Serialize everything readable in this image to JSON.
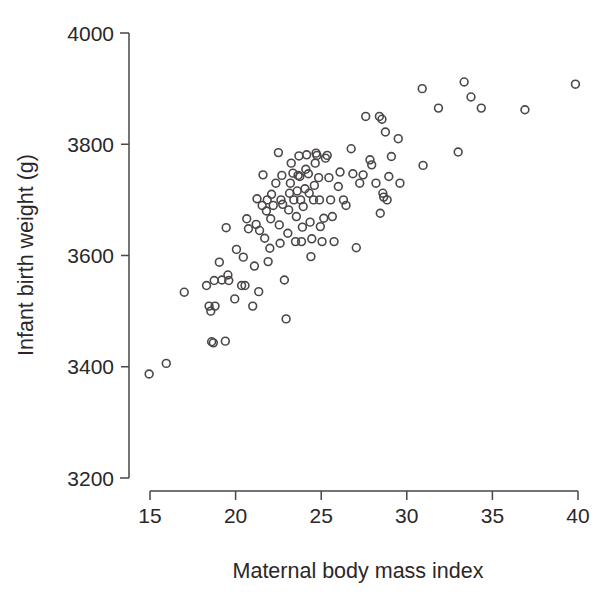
{
  "figure": {
    "background_color": "#ffffff",
    "marker_color": "#4b4748",
    "axis_color": "#4a4647"
  },
  "labels": {
    "x_axis_title": "Maternal body mass index",
    "y_axis_title": "Infant birth weight (g)"
  },
  "chart_data": {
    "type": "scatter",
    "title": "",
    "xlabel": "Maternal body mass index",
    "ylabel": "Infant birth weight (g)",
    "xlim": [
      15,
      40
    ],
    "ylim": [
      3200,
      4000
    ],
    "xticks": [
      15,
      20,
      25,
      30,
      35,
      40
    ],
    "yticks": [
      3200,
      3400,
      3600,
      3800,
      4000
    ],
    "xtick_labels": [
      "15",
      "20",
      "25",
      "30",
      "35",
      "40"
    ],
    "ytick_labels": [
      "3200",
      "3400",
      "3600",
      "3800",
      "4000"
    ],
    "grid": false,
    "legend": false,
    "marker": "open-circle",
    "marker_size": 7,
    "n_points": 121,
    "points": [
      [
        14.95,
        3387
      ],
      [
        15.95,
        3406
      ],
      [
        17.0,
        3534
      ],
      [
        18.3,
        3546
      ],
      [
        18.45,
        3509
      ],
      [
        18.55,
        3500
      ],
      [
        18.6,
        3445
      ],
      [
        18.7,
        3443
      ],
      [
        18.75,
        3555
      ],
      [
        18.8,
        3509
      ],
      [
        19.05,
        3588
      ],
      [
        19.2,
        3556
      ],
      [
        19.4,
        3446
      ],
      [
        19.45,
        3650
      ],
      [
        19.55,
        3565
      ],
      [
        19.6,
        3555
      ],
      [
        19.95,
        3522
      ],
      [
        20.05,
        3611
      ],
      [
        20.35,
        3546
      ],
      [
        20.45,
        3597
      ],
      [
        20.55,
        3546
      ],
      [
        20.65,
        3666
      ],
      [
        20.75,
        3648
      ],
      [
        21.0,
        3509
      ],
      [
        21.1,
        3581
      ],
      [
        21.2,
        3656
      ],
      [
        21.25,
        3702
      ],
      [
        21.35,
        3535
      ],
      [
        21.4,
        3645
      ],
      [
        21.55,
        3690
      ],
      [
        21.6,
        3745
      ],
      [
        21.7,
        3631
      ],
      [
        21.8,
        3680
      ],
      [
        21.85,
        3700
      ],
      [
        21.9,
        3589
      ],
      [
        22.0,
        3613
      ],
      [
        22.05,
        3666
      ],
      [
        22.1,
        3710
      ],
      [
        22.2,
        3690
      ],
      [
        22.35,
        3730
      ],
      [
        22.5,
        3785
      ],
      [
        22.55,
        3655
      ],
      [
        22.6,
        3622
      ],
      [
        22.65,
        3700
      ],
      [
        22.7,
        3744
      ],
      [
        22.75,
        3692
      ],
      [
        22.85,
        3556
      ],
      [
        22.95,
        3486
      ],
      [
        23.05,
        3640
      ],
      [
        23.1,
        3682
      ],
      [
        23.15,
        3712
      ],
      [
        23.2,
        3730
      ],
      [
        23.25,
        3766
      ],
      [
        23.35,
        3748
      ],
      [
        23.4,
        3700
      ],
      [
        23.5,
        3625
      ],
      [
        23.55,
        3670
      ],
      [
        23.6,
        3716
      ],
      [
        23.65,
        3744
      ],
      [
        23.7,
        3779
      ],
      [
        23.75,
        3742
      ],
      [
        23.8,
        3700
      ],
      [
        23.85,
        3625
      ],
      [
        23.9,
        3651
      ],
      [
        23.95,
        3688
      ],
      [
        24.05,
        3720
      ],
      [
        24.1,
        3755
      ],
      [
        24.15,
        3781
      ],
      [
        24.25,
        3747
      ],
      [
        24.3,
        3712
      ],
      [
        24.35,
        3660
      ],
      [
        24.4,
        3598
      ],
      [
        24.45,
        3630
      ],
      [
        24.55,
        3700
      ],
      [
        24.6,
        3726
      ],
      [
        24.65,
        3766
      ],
      [
        24.7,
        3784
      ],
      [
        24.75,
        3780
      ],
      [
        24.85,
        3740
      ],
      [
        24.9,
        3700
      ],
      [
        24.95,
        3652
      ],
      [
        25.05,
        3625
      ],
      [
        25.15,
        3667
      ],
      [
        25.25,
        3775
      ],
      [
        25.35,
        3780
      ],
      [
        25.45,
        3740
      ],
      [
        25.55,
        3700
      ],
      [
        25.65,
        3670
      ],
      [
        25.75,
        3625
      ],
      [
        26.0,
        3724
      ],
      [
        26.1,
        3750
      ],
      [
        26.3,
        3700
      ],
      [
        26.45,
        3690
      ],
      [
        26.75,
        3792
      ],
      [
        26.85,
        3747
      ],
      [
        27.05,
        3614
      ],
      [
        27.25,
        3730
      ],
      [
        27.45,
        3745
      ],
      [
        27.6,
        3850
      ],
      [
        27.85,
        3772
      ],
      [
        27.95,
        3763
      ],
      [
        28.2,
        3730
      ],
      [
        28.4,
        3850
      ],
      [
        28.45,
        3676
      ],
      [
        28.55,
        3845
      ],
      [
        28.6,
        3712
      ],
      [
        28.65,
        3705
      ],
      [
        28.75,
        3822
      ],
      [
        28.85,
        3700
      ],
      [
        28.95,
        3742
      ],
      [
        29.1,
        3778
      ],
      [
        29.5,
        3810
      ],
      [
        29.6,
        3730
      ],
      [
        30.9,
        3900
      ],
      [
        30.95,
        3762
      ],
      [
        31.85,
        3865
      ],
      [
        33.0,
        3786
      ],
      [
        33.35,
        3912
      ],
      [
        33.75,
        3885
      ],
      [
        34.35,
        3865
      ],
      [
        36.9,
        3862
      ],
      [
        39.85,
        3908
      ]
    ]
  }
}
